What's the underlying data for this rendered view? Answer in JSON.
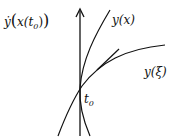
{
  "diagram": {
    "labels": {
      "derivative": "ẏ",
      "derivative_open": "(",
      "derivative_inner": "x(t",
      "derivative_sub": "0",
      "derivative_close": "))",
      "curve_x": "y(x)",
      "curve_xi": "y(ξ)",
      "point": "t",
      "point_sub": "0"
    },
    "colors": {
      "stroke": "#111111",
      "background": "#ffffff"
    }
  }
}
